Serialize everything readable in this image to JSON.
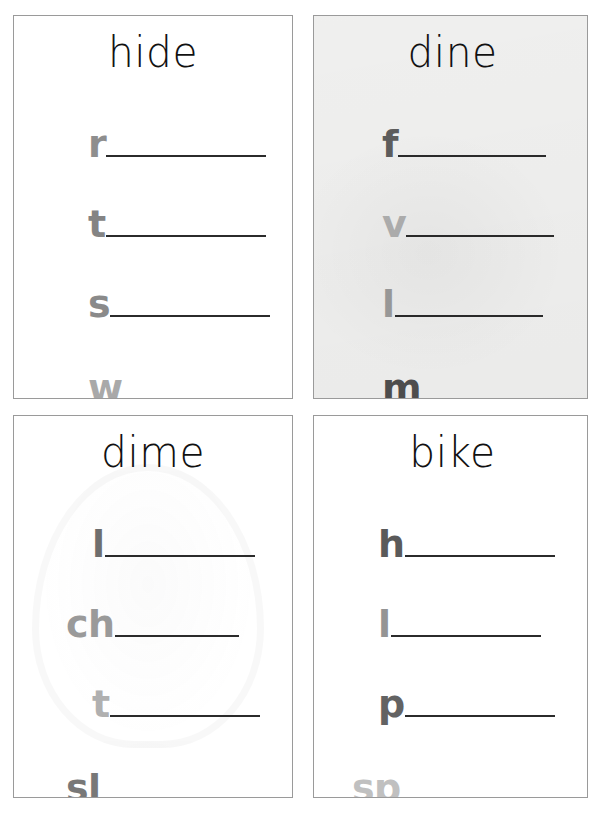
{
  "document": {
    "kind": "phonics-word-family-worksheet",
    "layout": "2x2-card-grid",
    "line_color": "#2b2b2b",
    "card_border_color": "#9a9a9a",
    "page_background": "#ffffff"
  },
  "cards": [
    {
      "id": "hide",
      "title": "hide",
      "position": "top-left",
      "background": "#ffffff",
      "tinted": false,
      "has_ghost_watermark": false,
      "rows": [
        {
          "prefix": "r",
          "color": "#8e8e8e",
          "blank": ""
        },
        {
          "prefix": "t",
          "color": "#848484",
          "blank": ""
        },
        {
          "prefix": "s",
          "color": "#8a8a8a",
          "blank": ""
        },
        {
          "prefix": "w",
          "color": "#a9a9a9",
          "blank": ""
        }
      ]
    },
    {
      "id": "dine",
      "title": "dine",
      "position": "top-right",
      "background": "#f2f2f1",
      "tinted": true,
      "has_ghost_watermark": false,
      "rows": [
        {
          "prefix": "f",
          "color": "#5e5e5e",
          "blank": ""
        },
        {
          "prefix": "v",
          "color": "#b3b3b3",
          "blank": ""
        },
        {
          "prefix": "l",
          "color": "#9e9e9e",
          "blank": ""
        },
        {
          "prefix": "m",
          "color": "#4f4f4f",
          "blank": ""
        }
      ]
    },
    {
      "id": "dime",
      "title": "dime",
      "position": "bottom-left",
      "background": "#ffffff",
      "tinted": false,
      "has_ghost_watermark": true,
      "rows": [
        {
          "prefix": "l",
          "color": "#6e6e6e",
          "blank": ""
        },
        {
          "prefix": "ch",
          "color": "#9a9a9a",
          "blank": ""
        },
        {
          "prefix": "t",
          "color": "#b0b0b0",
          "blank": ""
        },
        {
          "prefix": "sl",
          "color": "#787878",
          "blank": ""
        }
      ]
    },
    {
      "id": "bike",
      "title": "bike",
      "position": "bottom-right",
      "background": "#ffffff",
      "tinted": false,
      "has_ghost_watermark": false,
      "rows": [
        {
          "prefix": "h",
          "color": "#5a5a5a",
          "blank": ""
        },
        {
          "prefix": "l",
          "color": "#949494",
          "blank": ""
        },
        {
          "prefix": "p",
          "color": "#636363",
          "blank": ""
        },
        {
          "prefix": "sp",
          "color": "#c0c0c0",
          "blank": ""
        }
      ]
    }
  ]
}
